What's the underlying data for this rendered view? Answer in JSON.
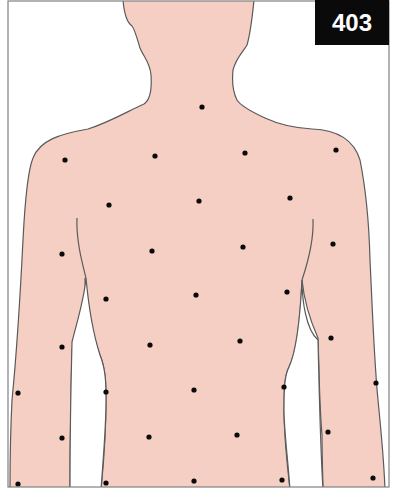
{
  "figure": {
    "label": "403",
    "colors": {
      "skin": "#f6cfc4",
      "outline": "#5a5a5a",
      "frame": "#808080",
      "dot": "#0a0a0a",
      "badge_bg": "#0a0a0a",
      "badge_text": "#ffffff"
    },
    "points": [
      {
        "x": 202,
        "y": 107
      },
      {
        "x": 65,
        "y": 160
      },
      {
        "x": 155,
        "y": 156
      },
      {
        "x": 245,
        "y": 153
      },
      {
        "x": 336,
        "y": 150
      },
      {
        "x": 109,
        "y": 205
      },
      {
        "x": 199,
        "y": 201
      },
      {
        "x": 290,
        "y": 198
      },
      {
        "x": 62,
        "y": 254
      },
      {
        "x": 152,
        "y": 251
      },
      {
        "x": 243,
        "y": 247
      },
      {
        "x": 333,
        "y": 244
      },
      {
        "x": 106,
        "y": 299
      },
      {
        "x": 196,
        "y": 295
      },
      {
        "x": 287,
        "y": 292
      },
      {
        "x": 62,
        "y": 347
      },
      {
        "x": 150,
        "y": 345
      },
      {
        "x": 240,
        "y": 341
      },
      {
        "x": 331,
        "y": 338
      },
      {
        "x": 18,
        "y": 393
      },
      {
        "x": 106,
        "y": 392
      },
      {
        "x": 194,
        "y": 390
      },
      {
        "x": 284,
        "y": 387
      },
      {
        "x": 376,
        "y": 383
      },
      {
        "x": 62,
        "y": 438
      },
      {
        "x": 149,
        "y": 437
      },
      {
        "x": 237,
        "y": 435
      },
      {
        "x": 328,
        "y": 432
      },
      {
        "x": 18,
        "y": 484
      },
      {
        "x": 106,
        "y": 483
      },
      {
        "x": 194,
        "y": 481
      },
      {
        "x": 282,
        "y": 480
      },
      {
        "x": 373,
        "y": 478
      }
    ]
  }
}
